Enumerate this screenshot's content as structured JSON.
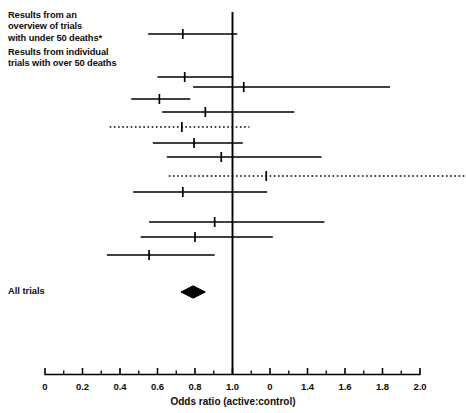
{
  "figure": {
    "type": "forest-plot",
    "headers": {
      "overview": "Results from an\noverview of trials\nwith under 50 deaths*",
      "individual": "Results from individual\ntrials with over 50 deaths"
    },
    "summary_label": "All trials",
    "xaxis": {
      "title": "Odds ratio (active:control)",
      "min": 0.0,
      "max": 2.0,
      "labels": [
        "0",
        "0.2",
        "0.4",
        "0.6",
        "0.8",
        "1.0",
        "0",
        "1.4",
        "1.6",
        "1.8",
        "2.0"
      ],
      "label_values": [
        0.0,
        0.2,
        0.4,
        0.6,
        0.8,
        1.0,
        1.2,
        1.4,
        1.6,
        1.8,
        2.0
      ],
      "minor_ticks": [
        0.1,
        0.3,
        0.5,
        0.7,
        0.9,
        1.1,
        1.3,
        1.5,
        1.7,
        1.9
      ],
      "reference_line": 1.0
    },
    "colors": {
      "ink": "#000000",
      "background": "#ffffff"
    }
  },
  "chart_data": {
    "type": "forest",
    "title": "",
    "xlabel": "Odds ratio (active:control)",
    "ylabel": "",
    "xlim": [
      0.0,
      2.0
    ],
    "grid": false,
    "legend": "none",
    "reference_line": 1.0,
    "xticks": [
      0.0,
      0.2,
      0.4,
      0.6,
      0.8,
      1.0,
      1.2,
      1.4,
      1.6,
      1.8,
      2.0
    ],
    "xticklabels": [
      "0",
      "0.2",
      "0.4",
      "0.6",
      "0.8",
      "1.0",
      "0",
      "1.4",
      "1.6",
      "1.8",
      "2.0"
    ],
    "rows": [
      {
        "group": "overview",
        "y": 34,
        "estimate": 0.735,
        "low": 0.55,
        "high": 1.025,
        "style": "solid"
      },
      {
        "group": "individual",
        "y": 77,
        "estimate": 0.745,
        "low": 0.6,
        "high": 1.005,
        "style": "solid"
      },
      {
        "group": "individual",
        "y": 87,
        "estimate": 1.06,
        "low": 0.79,
        "high": 1.84,
        "style": "solid"
      },
      {
        "group": "individual",
        "y": 99,
        "estimate": 0.61,
        "low": 0.46,
        "high": 0.775,
        "style": "solid"
      },
      {
        "group": "individual",
        "y": 112,
        "estimate": 0.855,
        "low": 0.625,
        "high": 1.33,
        "style": "solid"
      },
      {
        "group": "individual",
        "y": 127,
        "estimate": 0.73,
        "low": 0.345,
        "high": 1.09,
        "style": "dotted"
      },
      {
        "group": "individual",
        "y": 143,
        "estimate": 0.795,
        "low": 0.575,
        "high": 1.055,
        "style": "solid"
      },
      {
        "group": "individual",
        "y": 157,
        "estimate": 0.94,
        "low": 0.65,
        "high": 1.475,
        "style": "solid"
      },
      {
        "group": "individual",
        "y": 176,
        "estimate": 1.18,
        "low": 0.66,
        "high": 2.0,
        "style": "dotted"
      },
      {
        "group": "individual",
        "y": 192,
        "estimate": 0.735,
        "low": 0.47,
        "high": 1.185,
        "style": "solid"
      },
      {
        "group": "individual",
        "y": 222,
        "estimate": 0.905,
        "low": 0.555,
        "high": 1.49,
        "style": "solid"
      },
      {
        "group": "individual",
        "y": 237,
        "estimate": 0.8,
        "low": 0.51,
        "high": 1.215,
        "style": "solid"
      },
      {
        "group": "individual",
        "y": 255,
        "estimate": 0.555,
        "low": 0.33,
        "high": 0.905,
        "style": "solid"
      }
    ],
    "summary": {
      "label": "All trials",
      "y": 292,
      "estimate": 0.79,
      "low": 0.725,
      "high": 0.855,
      "marker": "diamond"
    }
  }
}
